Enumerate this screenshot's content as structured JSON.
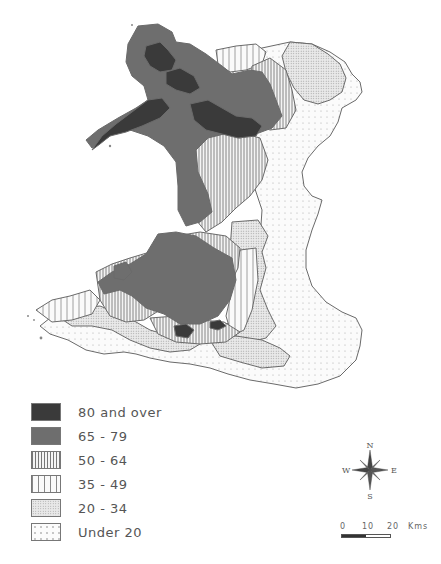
{
  "map": {
    "region": "Wales",
    "colors": {
      "band_80_plus": "#3a3a3a",
      "band_65_79": "#6e6e6e",
      "band_50_64": "#bdbdbd",
      "band_35_49": "#d8d8d8",
      "band_20_34": "#e6e6e6",
      "band_under_20": "#f6f6f6",
      "border": "#6a6a6a"
    }
  },
  "legend": {
    "items": [
      {
        "label": "80 and over",
        "pattern": "solid-dark"
      },
      {
        "label": "65 - 79",
        "pattern": "solid-mid"
      },
      {
        "label": "50 - 64",
        "pattern": "dense-vertical-lines"
      },
      {
        "label": "35 - 49",
        "pattern": "sparse-vertical-lines"
      },
      {
        "label": "20 - 34",
        "pattern": "dense-dots"
      },
      {
        "label": "Under 20",
        "pattern": "sparse-dots"
      }
    ]
  },
  "compass": {
    "icon": "compass-rose-icon",
    "n": "N",
    "s": "S",
    "e": "E",
    "w": "W"
  },
  "scale_bar": {
    "ticks": [
      "0",
      "10",
      "20"
    ],
    "unit": "Kms"
  }
}
